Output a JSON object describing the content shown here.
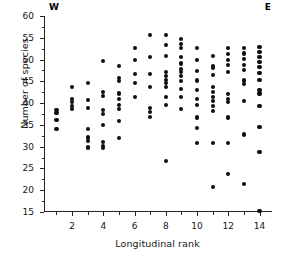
{
  "chart_data": {
    "type": "scatter",
    "title": "",
    "xlabel": "Longitudinal rank",
    "ylabel": "Number of species",
    "xlim": [
      0.2,
      14.8
    ],
    "ylim": [
      15,
      60
    ],
    "grid": false,
    "legend": "none",
    "xticks_major": [
      2,
      4,
      6,
      8,
      10,
      12,
      14
    ],
    "xticks_minor": [
      1,
      3,
      5,
      7,
      9,
      11,
      13
    ],
    "yticks_major": [
      15,
      20,
      25,
      30,
      35,
      40,
      45,
      50,
      55,
      60
    ],
    "annotations": [
      {
        "text": "W",
        "position": "top-left"
      },
      {
        "text": "E",
        "position": "top-right"
      }
    ],
    "marker": {
      "shape": "circle",
      "color": "#0d0d0d",
      "size": 4
    },
    "points": [
      {
        "x": 1,
        "y": 38.4
      },
      {
        "x": 1,
        "y": 37.8
      },
      {
        "x": 1,
        "y": 36.1
      },
      {
        "x": 1,
        "y": 34.1
      },
      {
        "x": 2,
        "y": 43.8
      },
      {
        "x": 2,
        "y": 41.0
      },
      {
        "x": 2,
        "y": 40.2
      },
      {
        "x": 2,
        "y": 39.4
      },
      {
        "x": 2,
        "y": 38.7
      },
      {
        "x": 3,
        "y": 44.6
      },
      {
        "x": 3,
        "y": 40.7
      },
      {
        "x": 3,
        "y": 38.9
      },
      {
        "x": 3,
        "y": 34.0
      },
      {
        "x": 3,
        "y": 32.1
      },
      {
        "x": 3,
        "y": 31.3
      },
      {
        "x": 3,
        "y": 29.8
      },
      {
        "x": 4,
        "y": 49.7
      },
      {
        "x": 4,
        "y": 42.6
      },
      {
        "x": 4,
        "y": 41.7
      },
      {
        "x": 4,
        "y": 38.4
      },
      {
        "x": 4,
        "y": 37.6
      },
      {
        "x": 4,
        "y": 35.0
      },
      {
        "x": 4,
        "y": 31.0
      },
      {
        "x": 4,
        "y": 30.1
      },
      {
        "x": 4,
        "y": 29.6
      },
      {
        "x": 5,
        "y": 48.6
      },
      {
        "x": 5,
        "y": 45.8
      },
      {
        "x": 5,
        "y": 45.1
      },
      {
        "x": 5,
        "y": 42.2
      },
      {
        "x": 5,
        "y": 40.9
      },
      {
        "x": 5,
        "y": 39.5
      },
      {
        "x": 5,
        "y": 38.7
      },
      {
        "x": 5,
        "y": 35.9
      },
      {
        "x": 5,
        "y": 31.9
      },
      {
        "x": 6,
        "y": 52.7
      },
      {
        "x": 6,
        "y": 49.8
      },
      {
        "x": 6,
        "y": 46.7
      },
      {
        "x": 6,
        "y": 44.6
      },
      {
        "x": 6,
        "y": 41.5
      },
      {
        "x": 7,
        "y": 55.7
      },
      {
        "x": 7,
        "y": 50.5
      },
      {
        "x": 7,
        "y": 46.6
      },
      {
        "x": 7,
        "y": 43.6
      },
      {
        "x": 7,
        "y": 38.8
      },
      {
        "x": 7,
        "y": 38.0
      },
      {
        "x": 7,
        "y": 36.8
      },
      {
        "x": 8,
        "y": 55.6
      },
      {
        "x": 8,
        "y": 53.4
      },
      {
        "x": 8,
        "y": 50.9
      },
      {
        "x": 8,
        "y": 47.2
      },
      {
        "x": 8,
        "y": 46.2
      },
      {
        "x": 8,
        "y": 45.4
      },
      {
        "x": 8,
        "y": 44.6
      },
      {
        "x": 8,
        "y": 43.8
      },
      {
        "x": 8,
        "y": 41.5
      },
      {
        "x": 8,
        "y": 39.6
      },
      {
        "x": 8,
        "y": 26.7
      },
      {
        "x": 9,
        "y": 54.7
      },
      {
        "x": 9,
        "y": 53.6
      },
      {
        "x": 9,
        "y": 52.6
      },
      {
        "x": 9,
        "y": 50.6
      },
      {
        "x": 9,
        "y": 49.1
      },
      {
        "x": 9,
        "y": 47.9
      },
      {
        "x": 9,
        "y": 47.1
      },
      {
        "x": 9,
        "y": 46.2
      },
      {
        "x": 9,
        "y": 45.0
      },
      {
        "x": 9,
        "y": 43.3
      },
      {
        "x": 9,
        "y": 41.3
      },
      {
        "x": 9,
        "y": 38.6
      },
      {
        "x": 10,
        "y": 52.6
      },
      {
        "x": 10,
        "y": 50.0
      },
      {
        "x": 10,
        "y": 47.4
      },
      {
        "x": 10,
        "y": 45.2
      },
      {
        "x": 10,
        "y": 43.0
      },
      {
        "x": 10,
        "y": 41.0
      },
      {
        "x": 10,
        "y": 39.6
      },
      {
        "x": 10,
        "y": 36.7
      },
      {
        "x": 10,
        "y": 34.2
      },
      {
        "x": 10,
        "y": 30.9
      },
      {
        "x": 11,
        "y": 50.8
      },
      {
        "x": 11,
        "y": 48.6
      },
      {
        "x": 11,
        "y": 48.0
      },
      {
        "x": 11,
        "y": 46.4
      },
      {
        "x": 11,
        "y": 43.6
      },
      {
        "x": 11,
        "y": 42.6
      },
      {
        "x": 11,
        "y": 41.5
      },
      {
        "x": 11,
        "y": 40.5
      },
      {
        "x": 11,
        "y": 39.4
      },
      {
        "x": 11,
        "y": 38.2
      },
      {
        "x": 11,
        "y": 30.9
      },
      {
        "x": 11,
        "y": 20.7
      },
      {
        "x": 12,
        "y": 52.7
      },
      {
        "x": 12,
        "y": 51.3
      },
      {
        "x": 12,
        "y": 50.0
      },
      {
        "x": 12,
        "y": 48.8
      },
      {
        "x": 12,
        "y": 47.2
      },
      {
        "x": 12,
        "y": 42.0
      },
      {
        "x": 12,
        "y": 41.0
      },
      {
        "x": 12,
        "y": 40.2
      },
      {
        "x": 12,
        "y": 36.7
      },
      {
        "x": 12,
        "y": 30.9
      },
      {
        "x": 12,
        "y": 23.7
      },
      {
        "x": 13,
        "y": 52.6
      },
      {
        "x": 13,
        "y": 51.4
      },
      {
        "x": 13,
        "y": 50.1
      },
      {
        "x": 13,
        "y": 48.8
      },
      {
        "x": 13,
        "y": 47.6
      },
      {
        "x": 13,
        "y": 45.2
      },
      {
        "x": 13,
        "y": 44.4
      },
      {
        "x": 13,
        "y": 40.4
      },
      {
        "x": 13,
        "y": 32.8
      },
      {
        "x": 13,
        "y": 21.5
      },
      {
        "x": 14,
        "y": 52.8
      },
      {
        "x": 14,
        "y": 51.7
      },
      {
        "x": 14,
        "y": 50.6
      },
      {
        "x": 14,
        "y": 49.4
      },
      {
        "x": 14,
        "y": 48.2
      },
      {
        "x": 14,
        "y": 46.9
      },
      {
        "x": 14,
        "y": 45.3
      },
      {
        "x": 14,
        "y": 43.1
      },
      {
        "x": 14,
        "y": 42.2
      },
      {
        "x": 14,
        "y": 39.3
      },
      {
        "x": 14,
        "y": 34.6
      },
      {
        "x": 14,
        "y": 28.8
      },
      {
        "x": 14,
        "y": 15.3
      }
    ]
  }
}
